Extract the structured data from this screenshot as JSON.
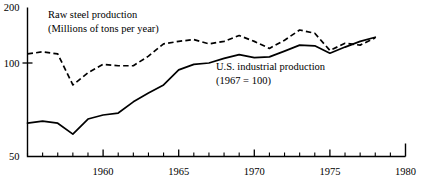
{
  "chart_data": {
    "type": "line",
    "title": "",
    "xlabel": "",
    "ylabel": "",
    "xlim": [
      1955,
      1980
    ],
    "ylim": [
      50,
      200
    ],
    "yscale": "log",
    "grid": false,
    "legend_position": "inline-annotation",
    "y_ticks": [
      50,
      100,
      200
    ],
    "y_tick_labels": [
      "50",
      "100",
      "200"
    ],
    "x_ticks": [
      1955,
      1956,
      1957,
      1958,
      1959,
      1960,
      1961,
      1962,
      1963,
      1964,
      1965,
      1966,
      1967,
      1968,
      1969,
      1970,
      1971,
      1972,
      1973,
      1974,
      1975,
      1976,
      1977,
      1978,
      1979,
      1980
    ],
    "x_major_ticks": [
      1960,
      1965,
      1970,
      1975,
      1980
    ],
    "x_tick_labels": [
      "1960",
      "1965",
      "1970",
      "1975",
      "1980"
    ],
    "annotations": [
      {
        "name": "raw-steel-label",
        "lines": [
          "Raw steel production",
          "(Millions of tons per year)"
        ],
        "x": 48,
        "y": 18
      },
      {
        "name": "industrial-production-label",
        "lines": [
          "U.S. industrial production",
          "(1967  =  100)"
        ],
        "x": 216,
        "y": 70
      }
    ],
    "series": [
      {
        "name": "Raw steel production",
        "style": "dashed",
        "unit": "millions of tons per year",
        "x": [
          1955,
          1956,
          1957,
          1958,
          1959,
          1960,
          1961,
          1962,
          1963,
          1964,
          1965,
          1966,
          1967,
          1968,
          1969,
          1970,
          1971,
          1972,
          1973,
          1974,
          1975,
          1976,
          1977,
          1978
        ],
        "values": [
          112,
          115,
          112,
          85,
          93,
          99,
          98,
          98,
          109,
          127,
          131,
          134,
          127,
          131,
          141,
          131,
          120,
          133,
          151,
          145,
          117,
          128,
          125,
          137
        ]
      },
      {
        "name": "U.S. industrial production",
        "style": "solid",
        "unit": "index, 1967 = 100",
        "x": [
          1955,
          1956,
          1957,
          1958,
          1959,
          1960,
          1961,
          1962,
          1963,
          1964,
          1965,
          1966,
          1967,
          1968,
          1969,
          1970,
          1971,
          1972,
          1973,
          1974,
          1975,
          1976,
          1977,
          1978
        ],
        "values": [
          64,
          65,
          64,
          59,
          66,
          68,
          69,
          75,
          80,
          85,
          95,
          99,
          100,
          106,
          111,
          107,
          108,
          116,
          125,
          124,
          113,
          122,
          131,
          138
        ]
      }
    ]
  }
}
